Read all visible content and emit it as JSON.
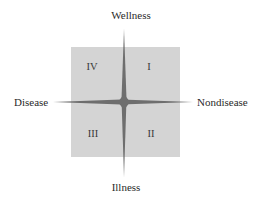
{
  "diagram": {
    "type": "quadrant-axes",
    "axes": {
      "top": "Wellness",
      "bottom": "Illness",
      "left": "Disease",
      "right": "Nondisease"
    },
    "quadrants": [
      {
        "id": "IV",
        "label": "IV",
        "position": "top-left"
      },
      {
        "id": "I",
        "label": "I",
        "position": "top-right"
      },
      {
        "id": "III",
        "label": "III",
        "position": "bottom-left"
      },
      {
        "id": "II",
        "label": "II",
        "position": "bottom-right"
      }
    ],
    "colors": {
      "square_fill": "#d4d4d4",
      "star_fill": "#6e6e6e",
      "text": "#2a2a2a"
    }
  }
}
